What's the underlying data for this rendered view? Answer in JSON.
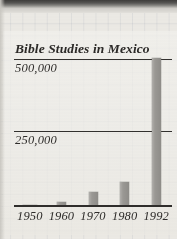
{
  "chart_data": {
    "type": "bar",
    "title": "Bible Studies in Mexico",
    "xlabel": "",
    "ylabel": "",
    "categories": [
      "1950",
      "1960",
      "1970",
      "1980",
      "1992"
    ],
    "values": [
      1000,
      13000,
      48000,
      82000,
      515000
    ],
    "ylim": [
      0,
      510000
    ],
    "yticks": [
      250000,
      500000
    ],
    "ytick_labels": [
      "250,000",
      "500,000"
    ],
    "grid": true,
    "legend": "none",
    "bar_color": "#9b9995",
    "axis_color": "#2f2d2b",
    "text_color": "#2e2c2a"
  },
  "figure": {
    "title": "Bible Studies in Mexico",
    "y_labels": {
      "upper": "500,000",
      "lower": "250,000"
    },
    "x_labels": [
      "1950",
      "1960",
      "1970",
      "1980",
      "1992"
    ]
  }
}
